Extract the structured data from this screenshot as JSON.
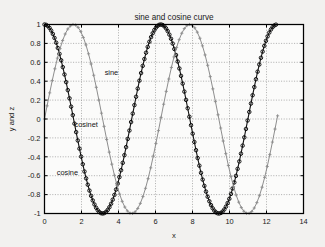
{
  "figure": {
    "background_color": "#f2f1ef",
    "plot_background_color": "#fbfbfa",
    "axis_color": "#000000",
    "grid_color": "#8d8d8d"
  },
  "chart_data": {
    "type": "line",
    "title": "sine and cosine curve",
    "xlabel": "x",
    "ylabel": "y and z",
    "xlim": [
      0,
      14
    ],
    "ylim": [
      -1,
      1
    ],
    "grid": true,
    "legend_position": "none",
    "xticks": [
      0,
      2,
      4,
      6,
      8,
      10,
      12,
      14
    ],
    "xtick_labels": [
      "0",
      "2",
      "4",
      "6",
      "8",
      "10",
      "12",
      "14"
    ],
    "yticks": [
      -1,
      -0.8,
      -0.6,
      -0.4,
      -0.2,
      0,
      0.2,
      0.4,
      0.6,
      0.8,
      1
    ],
    "ytick_labels": [
      "-1",
      "-0.8",
      "-0.6",
      "-0.4",
      "-0.2",
      "0",
      "0.2",
      "0.4",
      "0.6",
      "0.8",
      "1"
    ],
    "series": [
      {
        "name": "cosine",
        "color": "#111111",
        "marker": "circle",
        "formula": "cos(x)",
        "x_start": 0,
        "x_end": 12.55,
        "x_step": 0.09,
        "amplitude": 1,
        "phase": 0
      },
      {
        "name": "sine",
        "color": "#8e8e8e",
        "marker": "plus",
        "formula": "sin(x)",
        "x_start": 0,
        "x_end": 12.6,
        "x_step": 0.14,
        "amplitude": 1,
        "phase": -1.5707963
      }
    ],
    "annotations": [
      {
        "text": "sine",
        "x": 3.25,
        "y": 0.49
      },
      {
        "text": "cosinet",
        "x": 1.62,
        "y": -0.055
      },
      {
        "text": "cosine",
        "x": 0.66,
        "y": -0.565
      }
    ]
  }
}
